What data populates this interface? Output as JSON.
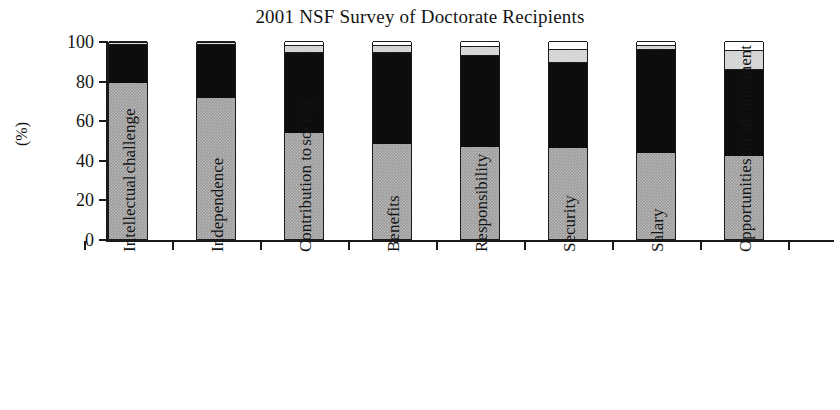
{
  "chart_data": {
    "type": "bar",
    "subtype": "stacked-bar",
    "title": "2001 NSF Survey of Doctorate Recipients",
    "xlabel": "",
    "ylabel": "(%)",
    "ylim": [
      0,
      100
    ],
    "yticks": [
      0,
      20,
      40,
      60,
      80,
      100
    ],
    "grid": false,
    "legend": "none",
    "categories": [
      "Intellectual challenge",
      "Independence",
      "Contribution to society",
      "Benefits",
      "Responsibility",
      "Security",
      "Salary",
      "Opportunities for advancement"
    ],
    "category_lines": [
      [
        "Intellectual",
        "challenge"
      ],
      [
        "Independence"
      ],
      [
        "Contribution to",
        "society"
      ],
      [
        "Benefits"
      ],
      [
        "Responsibility"
      ],
      [
        "Security"
      ],
      [
        "Salary"
      ],
      [
        "Opportunities",
        "for",
        "advancement"
      ]
    ],
    "series": [
      {
        "name": "Very important",
        "color": "#9a9a9a",
        "values": [
          79,
          71,
          53.5,
          48,
          46.5,
          46,
          43.5,
          42
        ]
      },
      {
        "name": "Somewhat important",
        "color": "#0d0d0d",
        "values": [
          19.5,
          27.5,
          41,
          46.5,
          46.5,
          43.5,
          52.5,
          44
        ]
      },
      {
        "name": "Somewhat unimportant",
        "color": "#cccccc",
        "values": [
          1.0,
          1.0,
          3.5,
          3.5,
          4.5,
          6.5,
          2.0,
          9.5
        ]
      },
      {
        "name": "Not important at all",
        "color": "#ffffff",
        "values": [
          0.5,
          0.5,
          2.0,
          2.0,
          2.5,
          4.0,
          2.0,
          4.5
        ]
      }
    ]
  }
}
